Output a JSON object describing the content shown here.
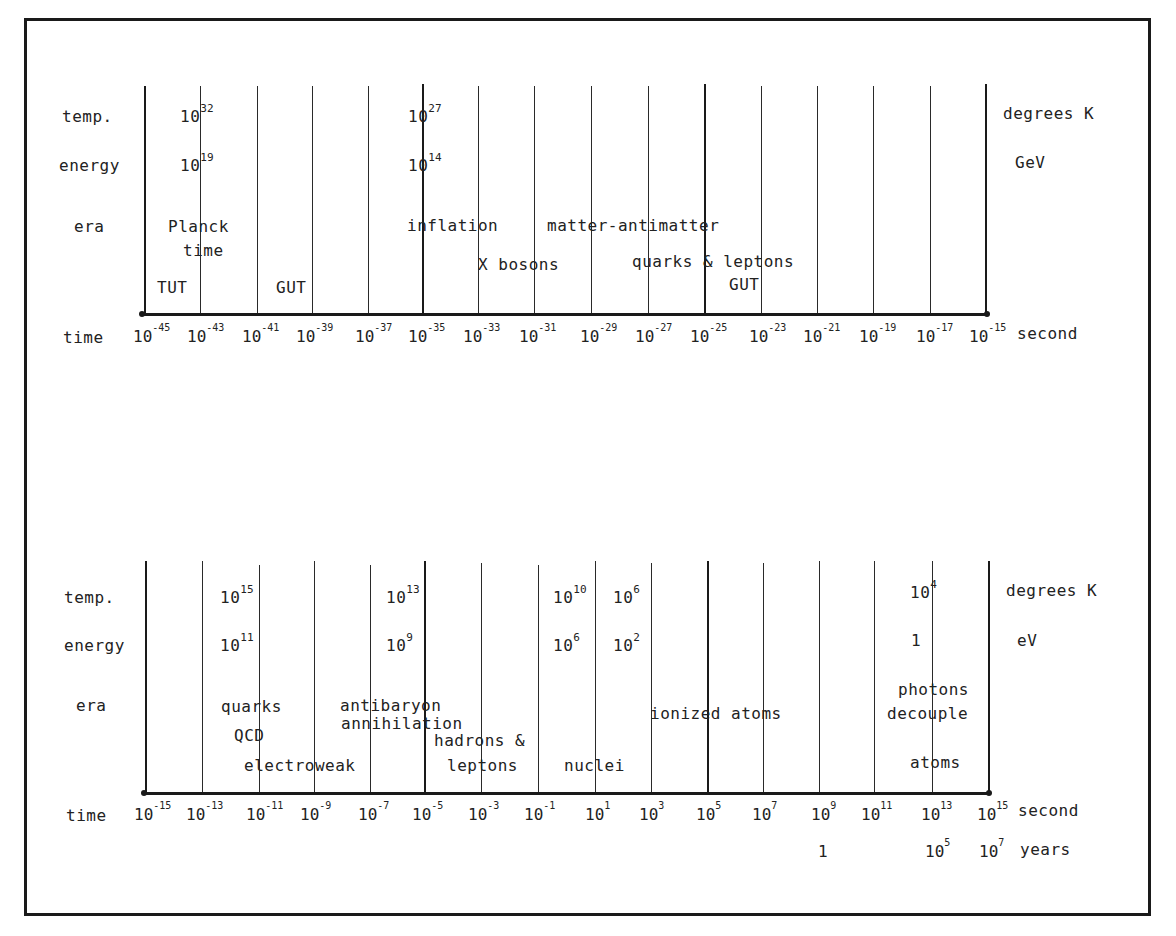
{
  "diagram": {
    "top_panel": {
      "row_labels": {
        "temp": "temp.",
        "energy": "energy",
        "era": "era",
        "time": "time"
      },
      "units": {
        "temp": "degrees K",
        "energy": "GeV",
        "time": "second"
      },
      "temp_values": [
        {
          "base": "10",
          "exp": "32"
        },
        {
          "base": "10",
          "exp": "27"
        }
      ],
      "energy_values": [
        {
          "base": "10",
          "exp": "19"
        },
        {
          "base": "10",
          "exp": "14"
        }
      ],
      "era_labels": {
        "planck": "Planck",
        "planck_time": "time",
        "tut": "TUT",
        "gut_left": "GUT",
        "inflation": "inflation",
        "matter_antimatter": "matter-antimatter",
        "x_bosons": "X bosons",
        "quarks_leptons": "quarks & leptons",
        "gut_right": "GUT"
      },
      "time_ticks": [
        {
          "base": "10",
          "exp": "-45"
        },
        {
          "base": "10",
          "exp": "-43"
        },
        {
          "base": "10",
          "exp": "-41"
        },
        {
          "base": "10",
          "exp": "-39"
        },
        {
          "base": "10",
          "exp": "-37"
        },
        {
          "base": "10",
          "exp": "-35"
        },
        {
          "base": "10",
          "exp": "-33"
        },
        {
          "base": "10",
          "exp": "-31"
        },
        {
          "base": "10",
          "exp": "-29"
        },
        {
          "base": "10",
          "exp": "-27"
        },
        {
          "base": "10",
          "exp": "-25"
        },
        {
          "base": "10",
          "exp": "-23"
        },
        {
          "base": "10",
          "exp": "-21"
        },
        {
          "base": "10",
          "exp": "-19"
        },
        {
          "base": "10",
          "exp": "-17"
        },
        {
          "base": "10",
          "exp": "-15"
        }
      ]
    },
    "bottom_panel": {
      "row_labels": {
        "temp": "temp.",
        "energy": "energy",
        "era": "era",
        "time": "time"
      },
      "units": {
        "temp": "degrees K",
        "energy": "eV",
        "time": "second",
        "years": "years"
      },
      "temp_values": [
        {
          "base": "10",
          "exp": "15"
        },
        {
          "base": "10",
          "exp": "13"
        },
        {
          "base": "10",
          "exp": "10"
        },
        {
          "base": "10",
          "exp": "6"
        },
        {
          "base": "10",
          "exp": "4"
        }
      ],
      "energy_values": [
        {
          "base": "10",
          "exp": "11"
        },
        {
          "base": "10",
          "exp": "9"
        },
        {
          "base": "10",
          "exp": "6"
        },
        {
          "base": "10",
          "exp": "2"
        },
        {
          "base": "1",
          "exp": ""
        }
      ],
      "era_labels": {
        "quarks": "quarks",
        "qcd": "QCD",
        "electroweak": "electroweak",
        "antibaryon": "antibaryon",
        "annihilation": "annihilation",
        "hadrons": "hadrons &",
        "leptons": "leptons",
        "nuclei": "nuclei",
        "ionized_atoms": "ionized atoms",
        "photons": "photons",
        "decouple": "decouple",
        "atoms": "atoms"
      },
      "time_ticks": [
        {
          "base": "10",
          "exp": "-15"
        },
        {
          "base": "10",
          "exp": "-13"
        },
        {
          "base": "10",
          "exp": "-11"
        },
        {
          "base": "10",
          "exp": "-9"
        },
        {
          "base": "10",
          "exp": "-7"
        },
        {
          "base": "10",
          "exp": "-5"
        },
        {
          "base": "10",
          "exp": "-3"
        },
        {
          "base": "10",
          "exp": "-1"
        },
        {
          "base": "10",
          "exp": "1"
        },
        {
          "base": "10",
          "exp": "3"
        },
        {
          "base": "10",
          "exp": "5"
        },
        {
          "base": "10",
          "exp": "7"
        },
        {
          "base": "10",
          "exp": "9"
        },
        {
          "base": "10",
          "exp": "11"
        },
        {
          "base": "10",
          "exp": "13"
        },
        {
          "base": "10",
          "exp": "15"
        }
      ],
      "years_ticks": [
        {
          "base": "1",
          "exp": ""
        },
        {
          "base": "10",
          "exp": "5"
        },
        {
          "base": "10",
          "exp": "7"
        }
      ]
    }
  }
}
